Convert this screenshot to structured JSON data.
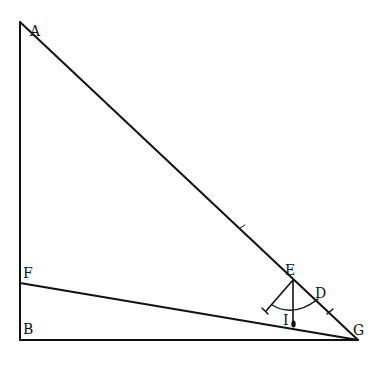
{
  "diagram": {
    "type": "geometric figure",
    "colors": {
      "line": "#111111",
      "background": "#ffffff"
    },
    "points": {
      "A": {
        "label": "A",
        "x": 20,
        "y": 22
      },
      "B": {
        "label": "B",
        "x": 20,
        "y": 340
      },
      "F": {
        "label": "F",
        "x": 20,
        "y": 283
      },
      "G": {
        "label": "G",
        "x": 358,
        "y": 340
      },
      "E": {
        "label": "E",
        "x": 293,
        "y": 280
      },
      "D": {
        "label": "D",
        "x": 318,
        "y": 299
      },
      "I": {
        "label": "I",
        "x": 294,
        "y": 311
      }
    },
    "segments": [
      "AB",
      "BG",
      "AG",
      "FG",
      "E-plumb",
      "E-arm"
    ],
    "instrument": "quadrant with plumb line at E"
  }
}
